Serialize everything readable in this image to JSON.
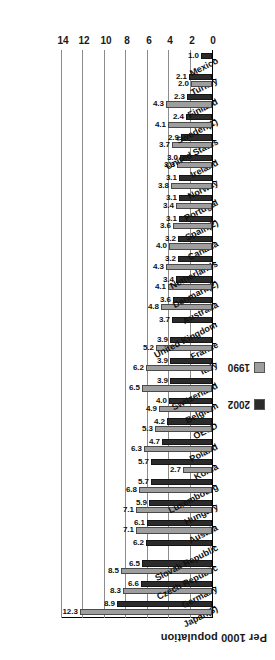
{
  "chart_data": {
    "type": "bar",
    "orientation": "horizontal",
    "title": "",
    "xlabel": "Per 1000 population",
    "ylabel": "",
    "xlim": [
      0,
      14
    ],
    "xticks": [
      0,
      2,
      4,
      6,
      8,
      10,
      12,
      14
    ],
    "grid": true,
    "legend_position": "left",
    "rotation_note": "figure rendered upside-down (180 degrees)",
    "legend": [
      {
        "name": "1990",
        "color": "#9e9e9e"
      },
      {
        "name": "2002",
        "color": "#2b2b2b"
      }
    ],
    "categories": [
      "Japan(3)",
      "Germany",
      "Czech Republic",
      "Slovak Republic",
      "Austria",
      "Hungary",
      "Luxembourg",
      "Korea",
      "Poland",
      "OECD",
      "Belgium",
      "Switzerland",
      "Italy",
      "France",
      "United Kingdom",
      "Australia",
      "Denmark(2)",
      "Netherlands",
      "Canada",
      "Spain(2)",
      "Portugal",
      "Norway",
      "Ireland",
      "United States",
      "Sweden(1)",
      "Finland",
      "Turkey",
      "Mexico"
    ],
    "series": [
      {
        "name": "1990",
        "color": "#9e9e9e",
        "values": [
          12.3,
          8.3,
          8.5,
          null,
          7.1,
          7.1,
          6.8,
          2.7,
          6.3,
          5.3,
          4.9,
          6.5,
          6.2,
          5.2,
          null,
          4.8,
          4.1,
          4.3,
          4.0,
          3.6,
          3.4,
          3.8,
          3.3,
          3.7,
          4.1,
          4.3,
          2.0,
          null
        ]
      },
      {
        "name": "2002",
        "color": "#2b2b2b",
        "values": [
          8.9,
          6.6,
          6.5,
          6.2,
          6.1,
          5.9,
          5.7,
          5.7,
          4.7,
          4.2,
          4.0,
          3.9,
          3.9,
          3.9,
          3.7,
          3.6,
          3.4,
          3.2,
          3.2,
          3.1,
          3.1,
          3.1,
          3.0,
          2.9,
          2.4,
          2.3,
          2.1,
          1.0
        ]
      }
    ]
  }
}
